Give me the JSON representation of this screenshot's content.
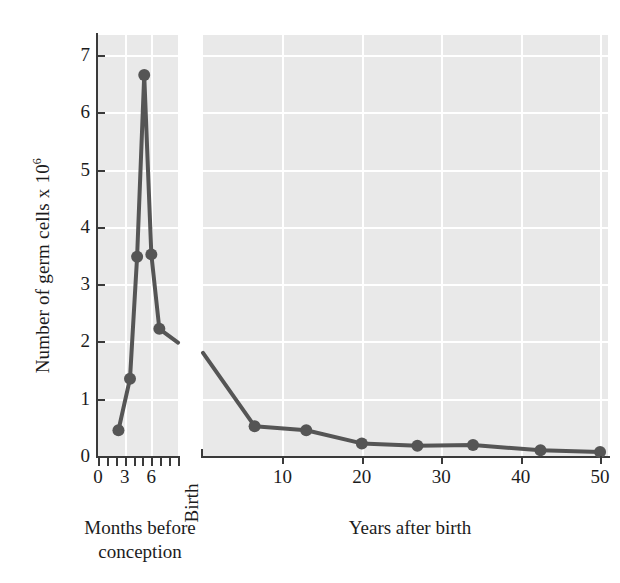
{
  "chart_data": {
    "type": "line",
    "title": "",
    "ylabel_text": "Number of germ cells x 10",
    "ylabel_exponent": "6",
    "ylim": [
      0,
      7.35
    ],
    "yticks": [
      0,
      1,
      2,
      3,
      4,
      5,
      6,
      7
    ],
    "grid": true,
    "legend": "none",
    "panels": [
      {
        "name": "left",
        "xlabel": "Months before conception",
        "xlim": [
          0,
          9
        ],
        "xticks_labeled": [
          0,
          3,
          6
        ],
        "xticks_minor": [
          0,
          1,
          2,
          3,
          4,
          5,
          6,
          7,
          8,
          9
        ],
        "x": [
          2.3,
          3.6,
          4.4,
          5.2,
          6.0,
          6.9
        ],
        "y": [
          0.45,
          1.35,
          3.48,
          6.65,
          3.52,
          2.22
        ],
        "trailing_segment_to": {
          "x": 9.0,
          "y": 1.98
        }
      },
      {
        "name": "right",
        "xlabel": "Years after birth",
        "xlim": [
          0,
          51
        ],
        "xticks_labeled": [
          10,
          20,
          30,
          40,
          50
        ],
        "birth_label": "Birth",
        "x": [
          0,
          6.5,
          13.0,
          20.0,
          27.0,
          34.0,
          42.5,
          50.0
        ],
        "y": [
          1.8,
          0.52,
          0.45,
          0.22,
          0.18,
          0.19,
          0.1,
          0.07
        ],
        "first_point_has_marker": false
      }
    ]
  },
  "axis": {
    "y_tick_labels": [
      "7",
      "6",
      "5",
      "4",
      "3",
      "2",
      "1",
      "0"
    ],
    "x_tick_labels_left": [
      "0",
      "3",
      "6"
    ],
    "x_tick_labels_right": [
      "10",
      "20",
      "30",
      "40",
      "50"
    ]
  },
  "labels": {
    "ylabel": "Number of germ cells x 10",
    "ylabel_sup": "6",
    "birth": "Birth",
    "caption_left_line1": "Months before",
    "caption_left_line2": "conception",
    "caption_right": "Years after birth"
  },
  "colors": {
    "series": "#555555",
    "panel_background": "#e9e9e9",
    "gridline": "#ffffff",
    "axis": "#3a3a3a",
    "text": "#1c1c1c"
  }
}
